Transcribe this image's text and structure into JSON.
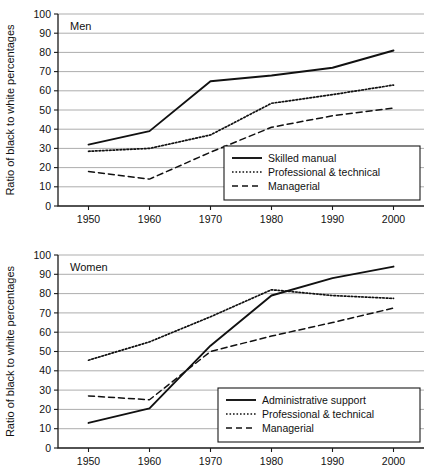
{
  "figure": {
    "width": 443,
    "height": 473,
    "background": "#ffffff",
    "line_color": "#111111",
    "grid_color": "#8a8a8a"
  },
  "chart_data": [
    {
      "type": "line",
      "title": "Men",
      "xlabel": "",
      "ylabel": "Ratio of black to white percentages",
      "x": [
        1950,
        1960,
        1970,
        1980,
        1990,
        2000
      ],
      "xticklabels": [
        "1950",
        "1960",
        "1970",
        "1980",
        "1990",
        "2000"
      ],
      "xlim": [
        1945,
        2005
      ],
      "ylim": [
        0,
        100
      ],
      "yticks": [
        0,
        10,
        20,
        30,
        40,
        50,
        60,
        70,
        80,
        90,
        100
      ],
      "yticklabels": [
        "0",
        "10",
        "20",
        "30",
        "40",
        "50",
        "60",
        "70",
        "80",
        "90",
        "100"
      ],
      "grid": "horizontal",
      "legend_position": "lower-right",
      "series": [
        {
          "name": "Skilled manual",
          "style": "solid",
          "values": [
            32,
            39,
            65,
            68,
            72,
            81
          ]
        },
        {
          "name": "Professional & technical",
          "style": "dotted",
          "values": [
            28.5,
            30,
            37,
            53.5,
            58,
            63
          ]
        },
        {
          "name": "Managerial",
          "style": "dashed",
          "values": [
            18,
            14,
            28,
            41,
            47,
            51
          ]
        }
      ]
    },
    {
      "type": "line",
      "title": "Women",
      "xlabel": "",
      "ylabel": "Ratio of black to white percentages",
      "x": [
        1950,
        1960,
        1970,
        1980,
        1990,
        2000
      ],
      "xticklabels": [
        "1950",
        "1960",
        "1970",
        "1980",
        "1990",
        "2000"
      ],
      "xlim": [
        1945,
        2005
      ],
      "ylim": [
        0,
        100
      ],
      "yticks": [
        0,
        10,
        20,
        30,
        40,
        50,
        60,
        70,
        80,
        90,
        100
      ],
      "yticklabels": [
        "0",
        "10",
        "20",
        "30",
        "40",
        "50",
        "60",
        "70",
        "80",
        "90",
        "100"
      ],
      "grid": "horizontal",
      "legend_position": "lower-right",
      "series": [
        {
          "name": "Administrative support",
          "style": "solid",
          "values": [
            13,
            20.5,
            53,
            79,
            88,
            94
          ]
        },
        {
          "name": "Professional & technical",
          "style": "dotted",
          "values": [
            45.5,
            55,
            68,
            82,
            79,
            77.5
          ]
        },
        {
          "name": "Managerial",
          "style": "dashed",
          "values": [
            27,
            25,
            50,
            58,
            65,
            72.5
          ]
        }
      ]
    }
  ]
}
